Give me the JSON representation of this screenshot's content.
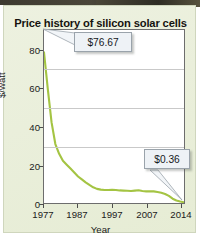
{
  "chart_data": {
    "type": "line",
    "title": "Price history of silicon solar cells",
    "xlabel": "Year",
    "ylabel": "$/watt",
    "xlim": [
      1977,
      2014
    ],
    "ylim": [
      0,
      88
    ],
    "xticks": [
      "1977",
      "1987",
      "1997",
      "2007",
      "2014"
    ],
    "xtick_values": [
      1977,
      1987,
      1997,
      2007,
      2014
    ],
    "yticks": [
      "0",
      "20",
      "40",
      "60",
      "80"
    ],
    "ytick_values": [
      0,
      20,
      40,
      60,
      80
    ],
    "grid": "horizontal",
    "legend": "none",
    "line_color": "#a4c443",
    "series": [
      {
        "name": "Silicon solar cell price",
        "x": [
          1977,
          1978,
          1979,
          1980,
          1981,
          1982,
          1983,
          1984,
          1985,
          1986,
          1987,
          1988,
          1989,
          1990,
          1991,
          1992,
          1993,
          1994,
          1995,
          1996,
          1997,
          1998,
          1999,
          2000,
          2001,
          2002,
          2003,
          2004,
          2005,
          2006,
          2007,
          2008,
          2009,
          2010,
          2011,
          2012,
          2013,
          2014
        ],
        "values": [
          76.67,
          58.0,
          41.0,
          30.0,
          25.0,
          21.5,
          19.5,
          17.5,
          15.5,
          13.5,
          12.0,
          10.5,
          9.2,
          8.0,
          7.2,
          6.8,
          6.6,
          6.6,
          6.7,
          6.6,
          6.4,
          6.3,
          6.2,
          6.1,
          6.3,
          6.5,
          6.1,
          5.9,
          6.0,
          5.9,
          5.6,
          5.2,
          4.6,
          3.6,
          2.2,
          1.3,
          0.75,
          0.36
        ]
      }
    ],
    "annotations": [
      {
        "name": "high-price-callout",
        "label": "$76.67",
        "x": 1977,
        "y": 76.67
      },
      {
        "name": "low-price-callout",
        "label": "$0.36",
        "x": 2014,
        "y": 0.36
      }
    ]
  },
  "chart": {
    "title": "Price history of silicon solar cells",
    "xlabel": "Year",
    "ylabel": "$/watt",
    "yticks": [
      "0",
      "20",
      "40",
      "60",
      "80"
    ],
    "xticks": [
      "1977",
      "1987",
      "1997",
      "2007",
      "2014"
    ],
    "callout_high": "$76.67",
    "callout_low": "$0.36"
  },
  "colors": {
    "line": "#a4c443",
    "background": "#e9eed9",
    "plot_background": "#ffffff",
    "callout_background": "#eef2f6",
    "gridline": "#c9c9c9",
    "axis": "#6d6d6d"
  }
}
